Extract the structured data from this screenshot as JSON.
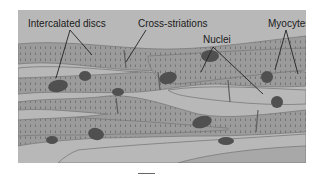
{
  "figure": {
    "labels": {
      "intercalated_discs": "Intercalated discs",
      "cross_striations": "Cross-striations",
      "nuclei": "Nuclei",
      "myocytes": "Myocytes"
    },
    "colors": {
      "background": "#b8b8b8",
      "cell": "#9b9b9b",
      "striation": "#6e6e6e",
      "nucleus": "#505050",
      "label_text": "#1a1a1a",
      "leader_line": "#222222"
    }
  }
}
